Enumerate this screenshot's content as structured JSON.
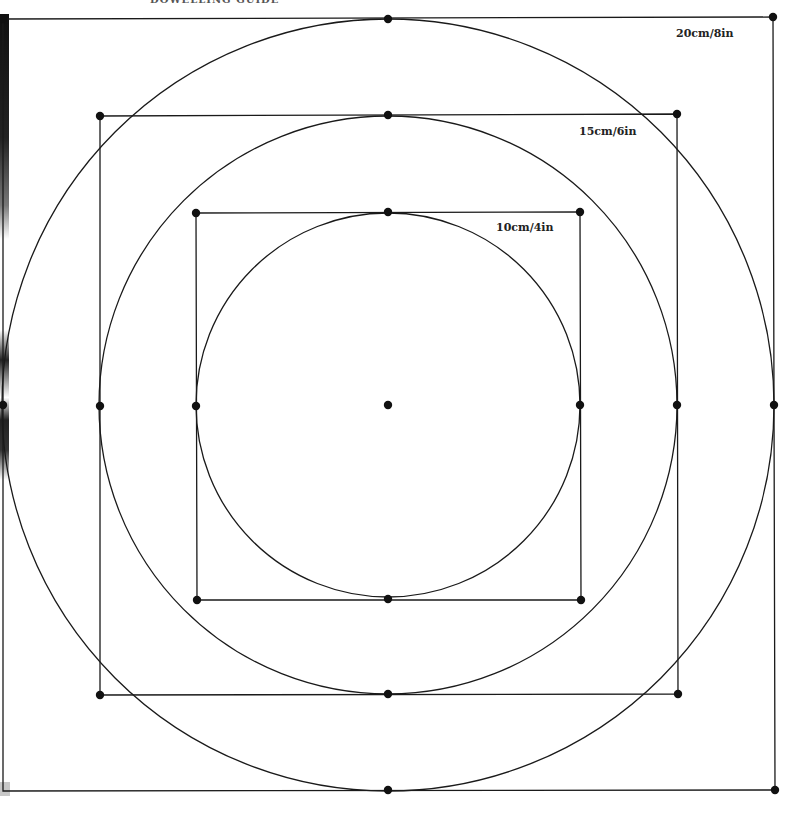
{
  "header": {
    "title": "DOWELLING GUIDE"
  },
  "colors": {
    "line": "#1a1a1a",
    "dot": "#111111",
    "background": "#ffffff",
    "label": "#222222"
  },
  "center": {
    "x": 388,
    "y": 405
  },
  "guides": [
    {
      "id": "outer",
      "label": "20cm/8in",
      "label_pos": {
        "x": 676,
        "y": 37
      },
      "circle_r": 386,
      "square": {
        "tl": [
          3,
          19
        ],
        "tr": [
          773,
          17
        ],
        "br": [
          775,
          790
        ],
        "bl": [
          3,
          791
        ]
      },
      "points": [
        [
          388,
          19
        ],
        [
          774,
          405
        ],
        [
          388,
          790
        ],
        [
          3,
          405
        ],
        [
          3,
          19
        ],
        [
          773,
          17
        ],
        [
          775,
          790
        ]
      ]
    },
    {
      "id": "middle",
      "label": "15cm/6in",
      "label_pos": {
        "x": 579,
        "y": 135
      },
      "circle_r": 289,
      "square": {
        "tl": [
          100,
          116
        ],
        "tr": [
          677,
          114
        ],
        "br": [
          678,
          694
        ],
        "bl": [
          100,
          695
        ]
      },
      "points": [
        [
          388,
          115
        ],
        [
          677,
          405
        ],
        [
          388,
          694
        ],
        [
          100,
          406
        ],
        [
          100,
          116
        ],
        [
          677,
          114
        ],
        [
          678,
          694
        ],
        [
          100,
          695
        ]
      ]
    },
    {
      "id": "inner",
      "label": "10cm/4in",
      "label_pos": {
        "x": 496,
        "y": 231
      },
      "circle_r": 192,
      "square": {
        "tl": [
          196,
          213
        ],
        "tr": [
          580,
          212
        ],
        "br": [
          581,
          600
        ],
        "bl": [
          197,
          600
        ]
      },
      "points": [
        [
          388,
          212
        ],
        [
          580,
          405
        ],
        [
          388,
          599
        ],
        [
          196,
          406
        ],
        [
          196,
          213
        ],
        [
          580,
          212
        ],
        [
          581,
          600
        ],
        [
          197,
          600
        ]
      ]
    }
  ]
}
